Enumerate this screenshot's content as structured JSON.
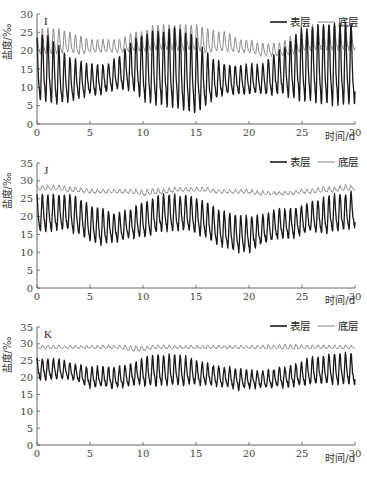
{
  "chart_data": [
    {
      "type": "line",
      "panel": "I",
      "title": "I",
      "xlabel": "时间/d",
      "ylabel": "盐度/‰",
      "xlim": [
        0,
        30
      ],
      "ylim": [
        0,
        30
      ],
      "xticks": [
        0,
        5,
        10,
        15,
        20,
        25,
        30
      ],
      "yticks": [
        0,
        5,
        10,
        15,
        20,
        25,
        30
      ],
      "legend": [
        "表层",
        "底层"
      ],
      "legend_position": "top-right",
      "grid": false,
      "series": [
        {
          "name": "表层",
          "color": "#1a1a1a",
          "width": 1.3,
          "period": 0.52,
          "mean": [
            15,
            15,
            13,
            12,
            12,
            12,
            12,
            13,
            14,
            16,
            15,
            15,
            15,
            15,
            14,
            13,
            12,
            12,
            12,
            12,
            12,
            12,
            13,
            14,
            15,
            16,
            16,
            16,
            16,
            16,
            16
          ],
          "amp": [
            9,
            9,
            8,
            6,
            5,
            4,
            4,
            4,
            5,
            7,
            9,
            10,
            10,
            11,
            11,
            10,
            7,
            5,
            4,
            4,
            4,
            4,
            5,
            6,
            8,
            10,
            10,
            11,
            11,
            11,
            11
          ]
        },
        {
          "name": "底层",
          "color": "#8c8c8c",
          "width": 1.0,
          "period": 0.52,
          "mean": [
            22,
            22,
            22,
            22,
            21,
            21,
            21,
            21,
            21,
            22,
            22,
            23,
            23,
            23,
            23,
            23,
            22,
            22,
            22,
            21,
            21,
            20,
            20,
            20,
            21,
            22,
            23,
            23,
            23,
            23,
            23
          ],
          "amp": [
            4,
            4,
            4,
            3,
            3,
            2,
            2,
            2,
            2,
            3,
            3,
            4,
            4,
            4,
            4,
            4,
            4,
            3,
            3,
            2,
            2,
            2,
            2,
            2,
            3,
            3,
            4,
            4,
            4,
            4,
            4
          ]
        }
      ]
    },
    {
      "type": "line",
      "panel": "J",
      "title": "J",
      "xlabel": "时间/d",
      "ylabel": "盐度/‰",
      "xlim": [
        0,
        30
      ],
      "ylim": [
        0,
        35
      ],
      "xticks": [
        0,
        5,
        10,
        15,
        20,
        25,
        30
      ],
      "yticks": [
        0,
        5,
        10,
        15,
        20,
        25,
        30,
        35
      ],
      "legend": [
        "表层",
        "底层"
      ],
      "legend_position": "top-right",
      "grid": false,
      "series": [
        {
          "name": "表层",
          "color": "#1a1a1a",
          "width": 1.3,
          "period": 0.52,
          "mean": [
            21,
            21,
            21,
            21,
            20,
            18,
            17,
            17,
            17,
            18,
            19,
            20,
            21,
            21,
            21,
            20,
            19,
            17,
            16,
            15,
            15,
            16,
            17,
            18,
            18,
            19,
            20,
            20,
            21,
            21,
            22
          ],
          "amp": [
            5,
            5,
            5,
            5,
            5,
            5,
            5,
            4,
            4,
            4,
            5,
            5,
            5,
            5,
            5,
            5,
            5,
            5,
            5,
            5,
            5,
            4,
            4,
            4,
            4,
            4,
            4,
            5,
            5,
            5,
            5
          ]
        },
        {
          "name": "底层",
          "color": "#8c8c8c",
          "width": 1.0,
          "period": 0.52,
          "mean": [
            28,
            28,
            28,
            27.5,
            27.5,
            27,
            27,
            27,
            27,
            27,
            26.5,
            27,
            27,
            27.5,
            27.5,
            27.5,
            27.5,
            27,
            27,
            27,
            27,
            26.5,
            26.5,
            26.5,
            26.5,
            27,
            27,
            27.5,
            27.5,
            28,
            28
          ],
          "amp": [
            0.8,
            0.8,
            0.8,
            0.8,
            0.7,
            0.7,
            0.6,
            0.6,
            0.6,
            0.7,
            0.9,
            0.9,
            0.8,
            0.7,
            0.7,
            0.7,
            0.7,
            0.6,
            0.6,
            0.6,
            0.6,
            0.6,
            0.5,
            0.5,
            0.6,
            0.6,
            0.7,
            0.8,
            0.8,
            0.8,
            0.8
          ]
        }
      ]
    },
    {
      "type": "line",
      "panel": "K",
      "title": "K",
      "xlabel": "时间/d",
      "ylabel": "盐度/‰",
      "xlim": [
        0,
        30
      ],
      "ylim": [
        0,
        35
      ],
      "xticks": [
        0,
        5,
        10,
        15,
        20,
        25,
        30
      ],
      "yticks": [
        0,
        5,
        10,
        15,
        20,
        25,
        30,
        35
      ],
      "legend": [
        "表层",
        "底层"
      ],
      "legend_position": "top-right",
      "grid": false,
      "series": [
        {
          "name": "表层",
          "color": "#1a1a1a",
          "width": 1.3,
          "period": 0.52,
          "mean": [
            22.5,
            22.5,
            22.5,
            22,
            21,
            20,
            20,
            20,
            20,
            21,
            21.5,
            22,
            22,
            22,
            22,
            21.5,
            21,
            20.5,
            20,
            19.5,
            19.5,
            19.5,
            19.5,
            20,
            20.5,
            21,
            22,
            22,
            22.5,
            22.5,
            22.5
          ],
          "amp": [
            3,
            3,
            3,
            2.5,
            2.5,
            3,
            3,
            3,
            3,
            3,
            4,
            4.5,
            4.5,
            4.5,
            4,
            3.5,
            3,
            3,
            3,
            3,
            2.5,
            2.5,
            2.5,
            3,
            3,
            3.5,
            4,
            4,
            4.5,
            4.5,
            4.5
          ]
        },
        {
          "name": "底层",
          "color": "#8c8c8c",
          "width": 1.0,
          "period": 0.52,
          "mean": [
            29,
            29,
            29,
            29,
            29,
            29,
            29,
            29,
            29,
            28.5,
            28.5,
            29,
            29,
            29,
            29,
            29,
            29,
            29,
            29,
            29,
            29,
            29,
            29,
            29,
            29,
            29,
            29,
            29,
            29,
            29,
            29
          ],
          "amp": [
            0.6,
            0.6,
            0.6,
            0.5,
            0.5,
            0.5,
            0.5,
            0.5,
            0.6,
            0.9,
            0.8,
            0.6,
            0.6,
            0.5,
            0.5,
            0.5,
            0.5,
            0.5,
            0.5,
            0.5,
            0.5,
            0.6,
            0.7,
            0.8,
            0.8,
            0.7,
            0.6,
            0.6,
            0.6,
            0.6,
            0.6
          ]
        }
      ]
    }
  ],
  "panels": [
    {
      "label": "I",
      "ymax": 30,
      "x0": 37,
      "x1": 355,
      "yTop": 14,
      "yBottom": 124,
      "xlabel_y": 140
    },
    {
      "label": "J",
      "ymax": 35,
      "x0": 37,
      "x1": 355,
      "yTop": 163,
      "yBottom": 288,
      "xlabel_y": 304
    },
    {
      "label": "K",
      "ymax": 35,
      "x0": 37,
      "x1": 355,
      "yTop": 327,
      "yBottom": 445,
      "xlabel_y": 462
    }
  ],
  "legend": {
    "surface": "表层",
    "bottom": "底层"
  },
  "axis": {
    "xlabel": "时间/d",
    "ylabel": "盐度/‰"
  }
}
